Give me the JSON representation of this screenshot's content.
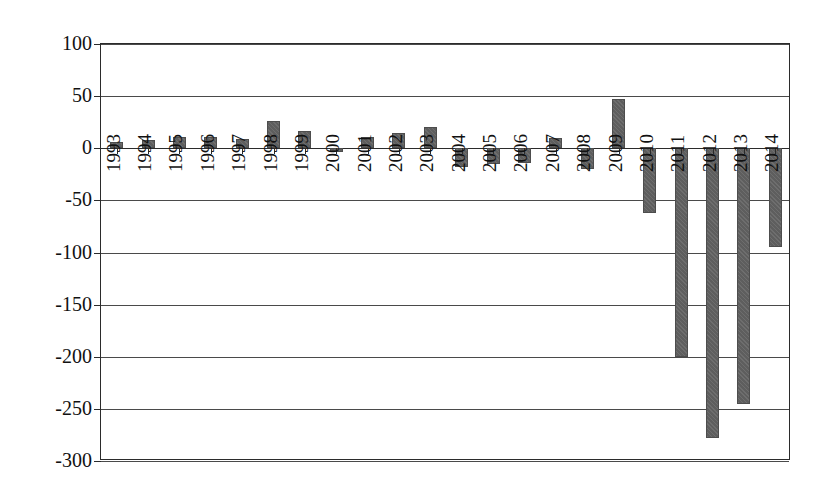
{
  "chart_data": {
    "type": "bar",
    "title": "",
    "subtitle": "",
    "xlabel": "",
    "ylabel": "",
    "grid": true,
    "legend": "none",
    "orientation": "vertical",
    "bar_color": "#5e5e5e",
    "ylim": [
      -300,
      100
    ],
    "ytick_step": 50,
    "yticks": [
      100,
      50,
      0,
      -50,
      -100,
      -150,
      -200,
      -250,
      -300
    ],
    "ytick_labels": [
      "100",
      "50",
      "0",
      "-50",
      "-100",
      "-150",
      "-200",
      "-250",
      "-300"
    ],
    "categories": [
      "1993",
      "1994",
      "1995",
      "1996",
      "1997",
      "1998",
      "1999",
      "2000",
      "2001",
      "2002",
      "2003",
      "2004",
      "2005",
      "2006",
      "2007",
      "2008",
      "2009",
      "2010",
      "2011",
      "2012",
      "2013",
      "2014"
    ],
    "values": [
      6,
      8,
      11,
      11,
      9,
      26,
      17,
      -4,
      11,
      15,
      20,
      -18,
      -15,
      -14,
      10,
      -20,
      47,
      -62,
      -200,
      -278,
      -245,
      -95
    ],
    "xtick_label_rotation": 90
  }
}
